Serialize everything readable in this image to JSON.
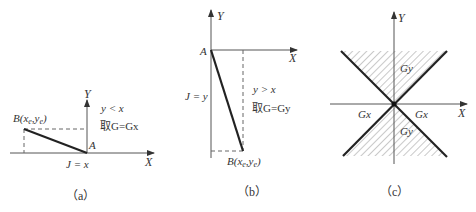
{
  "panels": [
    {
      "id": "a",
      "caption": "（a）",
      "axis_x": "X",
      "axis_y": "Y",
      "start_point": "A",
      "end_point": "B(xₑ,yₑ)",
      "end_point_main": "B(x",
      "end_point_sub1": "e",
      "end_point_mid": ",y",
      "end_point_sub2": "e",
      "end_point_close": ")",
      "condition": "y < x",
      "rule": "取G=Gx",
      "counter": "J = x"
    },
    {
      "id": "b",
      "caption": "（b）",
      "axis_x": "X",
      "axis_y": "Y",
      "start_point": "A",
      "end_point_main": "B(x",
      "end_point_sub1": "e",
      "end_point_mid": ",y",
      "end_point_sub2": "e",
      "end_point_close": ")",
      "condition": "y > x",
      "rule": "取G=Gy",
      "counter": "J = y"
    },
    {
      "id": "c",
      "caption": "（c）",
      "axis_x": "X",
      "axis_y": "Y",
      "region_labels": {
        "top": "Gy",
        "bottom": "Gy",
        "left": "Gx",
        "right": "Gx"
      }
    }
  ]
}
